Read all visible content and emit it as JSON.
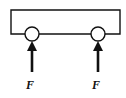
{
  "diagram": {
    "colors": {
      "stroke": "#111111",
      "background": "#ffffff"
    },
    "frame": {
      "left": 11,
      "right": 120,
      "top": 10,
      "bottom": 34
    },
    "rollers": [
      {
        "cx": 32,
        "cy": 34,
        "r": 7
      },
      {
        "cx": 98,
        "cy": 34,
        "r": 7
      }
    ],
    "forces": [
      {
        "label": "F",
        "x": 32,
        "y_tail": 72,
        "y_head": 41,
        "direction": "up"
      },
      {
        "label": "F",
        "x": 98,
        "y_tail": 72,
        "y_head": 41,
        "direction": "up"
      }
    ]
  }
}
